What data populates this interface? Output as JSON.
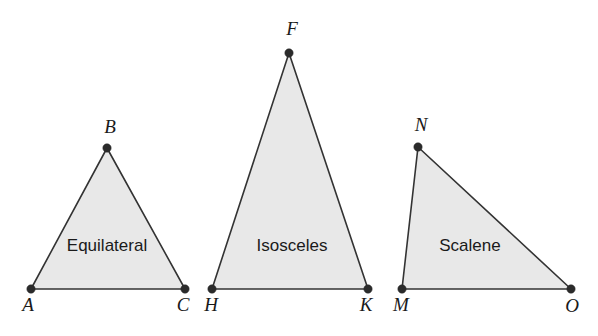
{
  "figure": {
    "background_color": "#ffffff",
    "fill_color": "#e8e8e8",
    "stroke_color": "#333333",
    "label_color": "#1a1a1a",
    "width": 598,
    "height": 336
  },
  "triangles": [
    {
      "name": "equilateral",
      "label": "Equilateral",
      "label_x": 107,
      "label_y": 247,
      "points": "31,289 107,148 185,289",
      "vertices": [
        {
          "letter": "A",
          "cx": 31,
          "cy": 289,
          "lx": 28,
          "ly": 307
        },
        {
          "letter": "B",
          "cx": 107,
          "cy": 148,
          "lx": 110,
          "ly": 129
        },
        {
          "letter": "C",
          "cx": 185,
          "cy": 289,
          "lx": 183,
          "ly": 307
        }
      ]
    },
    {
      "name": "isosceles",
      "label": "Isosceles",
      "label_x": 292,
      "label_y": 247,
      "points": "212,289 289,53 368,289",
      "vertices": [
        {
          "letter": "H",
          "cx": 212,
          "cy": 289,
          "lx": 211,
          "ly": 307
        },
        {
          "letter": "F",
          "cx": 289,
          "cy": 53,
          "lx": 292,
          "ly": 31
        },
        {
          "letter": "K",
          "cx": 368,
          "cy": 289,
          "lx": 366,
          "ly": 307
        }
      ]
    },
    {
      "name": "scalene",
      "label": "Scalene",
      "label_x": 470,
      "label_y": 247,
      "points": "402,289 418,147 571,289",
      "vertices": [
        {
          "letter": "M",
          "cx": 402,
          "cy": 289,
          "lx": 401,
          "ly": 307
        },
        {
          "letter": "N",
          "cx": 418,
          "cy": 147,
          "lx": 421,
          "ly": 127
        },
        {
          "letter": "O",
          "cx": 571,
          "cy": 289,
          "lx": 572,
          "ly": 308
        }
      ]
    }
  ]
}
